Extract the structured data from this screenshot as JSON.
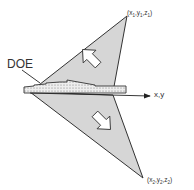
{
  "diagram": {
    "labels": {
      "point1": "(x",
      "point1_sub": "1",
      "point1_sep1": ",y",
      "point1_sep2": ",z",
      "point1_close": ")",
      "point2": "(x",
      "point2_sub": "2",
      "point2_sep1": ",y",
      "point2_sep2": ",z",
      "point2_close": ")",
      "doe": "DOE",
      "axis": "x,y"
    },
    "colors": {
      "triangle_fill": "#d4d4d4",
      "stroke": "#333333",
      "doe_fill": "#e8e8e8"
    }
  }
}
